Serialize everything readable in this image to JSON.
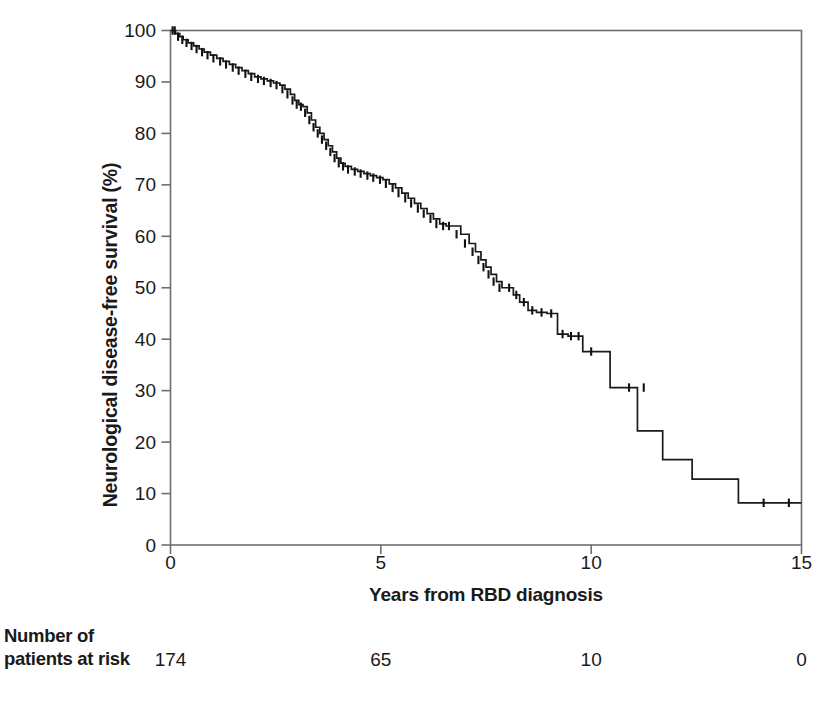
{
  "chart_data": {
    "type": "line",
    "subtype": "kaplan-meier-step",
    "title": "",
    "xlabel": "Years from RBD diagnosis",
    "ylabel": "Neurological disease-free survival (%)",
    "xlim": [
      0,
      15
    ],
    "ylim": [
      0,
      100
    ],
    "xticks": [
      0,
      5,
      10,
      15
    ],
    "xtick_labels": [
      "0",
      "5",
      "10",
      "15"
    ],
    "yticks": [
      0,
      10,
      20,
      30,
      40,
      50,
      60,
      70,
      80,
      90,
      100
    ],
    "ytick_labels": [
      "0",
      "10",
      "20",
      "30",
      "40",
      "50",
      "60",
      "70",
      "80",
      "90",
      "100"
    ],
    "grid": false,
    "legend": false,
    "line_color": "#1a1a1a",
    "frame_color": "#6e6e6e",
    "series": [
      {
        "name": "Neurological disease-free survival",
        "step": "post",
        "x": [
          0.0,
          0.12,
          0.22,
          0.3,
          0.42,
          0.55,
          0.68,
          0.8,
          0.95,
          1.1,
          1.25,
          1.4,
          1.55,
          1.7,
          1.85,
          2.0,
          2.15,
          2.3,
          2.45,
          2.6,
          2.72,
          2.85,
          2.95,
          3.05,
          3.15,
          3.25,
          3.35,
          3.45,
          3.55,
          3.65,
          3.75,
          3.85,
          3.95,
          4.05,
          4.15,
          4.3,
          4.45,
          4.6,
          4.75,
          4.9,
          5.05,
          5.2,
          5.35,
          5.5,
          5.65,
          5.8,
          5.95,
          6.1,
          6.25,
          6.4,
          6.55,
          6.7,
          6.9,
          7.1,
          7.25,
          7.38,
          7.5,
          7.62,
          7.75,
          7.88,
          8.0,
          8.15,
          8.3,
          8.5,
          8.7,
          8.95,
          9.2,
          9.45,
          9.6,
          9.8,
          10.1,
          10.45,
          10.8,
          11.1,
          11.4,
          11.7,
          12.0,
          12.4,
          13.5,
          15.0
        ],
        "y": [
          100.0,
          99.4,
          98.8,
          98.2,
          97.6,
          97.0,
          96.4,
          95.8,
          95.2,
          94.6,
          94.0,
          93.4,
          92.8,
          92.2,
          91.6,
          91.0,
          90.6,
          90.2,
          89.8,
          89.4,
          88.6,
          87.6,
          86.4,
          85.6,
          85.2,
          84.0,
          82.6,
          81.2,
          80.0,
          78.8,
          77.6,
          76.4,
          75.2,
          74.2,
          73.6,
          73.0,
          72.6,
          72.2,
          71.8,
          71.4,
          71.0,
          70.2,
          69.4,
          68.4,
          67.4,
          66.4,
          65.4,
          64.4,
          63.4,
          62.4,
          62.0,
          62.0,
          60.4,
          58.6,
          57.0,
          55.4,
          54.0,
          52.6,
          51.2,
          50.0,
          50.0,
          48.6,
          47.2,
          45.6,
          45.2,
          45.0,
          41.0,
          40.6,
          40.6,
          37.6,
          37.6,
          30.6,
          30.6,
          22.2,
          22.2,
          16.6,
          16.6,
          12.8,
          8.2,
          8.2
        ],
        "censored_x": [
          0.05,
          0.1,
          0.18,
          0.28,
          0.38,
          0.5,
          0.62,
          0.75,
          0.88,
          1.02,
          1.18,
          1.32,
          1.48,
          1.62,
          1.78,
          1.92,
          2.08,
          2.22,
          2.38,
          2.52,
          2.66,
          2.78,
          2.9,
          3.0,
          3.1,
          3.2,
          3.3,
          3.4,
          3.5,
          3.6,
          3.7,
          3.8,
          3.9,
          4.0,
          4.1,
          4.22,
          4.38,
          4.52,
          4.68,
          4.82,
          4.98,
          5.12,
          5.28,
          5.42,
          5.58,
          5.72,
          5.88,
          6.02,
          6.18,
          6.32,
          6.48,
          6.62,
          6.8,
          7.0,
          7.18,
          7.32,
          7.44,
          7.56,
          7.68,
          7.82,
          8.05,
          8.22,
          8.4,
          8.6,
          8.82,
          9.05,
          9.32,
          9.52,
          9.7,
          10.0,
          10.9,
          11.25,
          14.1,
          14.7
        ],
        "censored_y": [
          100.0,
          100.0,
          98.8,
          98.2,
          97.6,
          97.0,
          96.4,
          95.8,
          95.2,
          94.6,
          94.0,
          93.4,
          92.8,
          92.2,
          91.6,
          91.0,
          90.6,
          90.2,
          89.8,
          89.4,
          88.6,
          87.6,
          86.4,
          85.6,
          85.2,
          84.0,
          82.6,
          81.2,
          80.0,
          78.8,
          77.6,
          76.4,
          75.2,
          74.2,
          73.6,
          73.0,
          72.6,
          72.2,
          71.8,
          71.4,
          71.0,
          70.2,
          69.4,
          68.4,
          67.4,
          66.4,
          65.4,
          64.4,
          63.4,
          62.4,
          62.0,
          62.0,
          60.4,
          58.6,
          57.0,
          55.4,
          54.0,
          52.6,
          51.2,
          50.0,
          50.0,
          48.6,
          47.2,
          45.6,
          45.2,
          45.0,
          41.0,
          40.6,
          40.6,
          37.6,
          30.6,
          30.6,
          8.2,
          8.2
        ]
      }
    ]
  },
  "risk_table": {
    "title_line1": "Number of",
    "title_line2": "patients at risk",
    "times": [
      0,
      5,
      10,
      15
    ],
    "values": [
      "174",
      "65",
      "10",
      "0"
    ]
  }
}
